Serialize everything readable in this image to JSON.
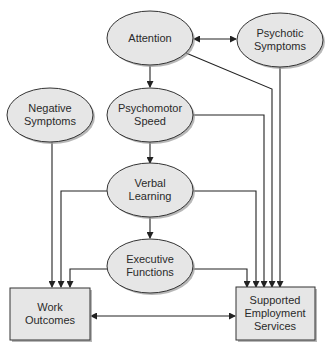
{
  "diagram": {
    "nodes": {
      "attention": {
        "label": "Attention",
        "shape": "ellipse"
      },
      "psychotic": {
        "label_line1": "Psychotic",
        "label_line2": "Symptoms",
        "shape": "ellipse"
      },
      "negative": {
        "label_line1": "Negative",
        "label_line2": "Symptoms",
        "shape": "ellipse"
      },
      "psychomotor": {
        "label_line1": "Psychomotor",
        "label_line2": "Speed",
        "shape": "ellipse"
      },
      "verbal": {
        "label_line1": "Verbal",
        "label_line2": "Learning",
        "shape": "ellipse"
      },
      "executive": {
        "label_line1": "Executive",
        "label_line2": "Functions",
        "shape": "ellipse"
      },
      "work": {
        "label_line1": "Work",
        "label_line2": "Outcomes",
        "shape": "box"
      },
      "ses": {
        "label_line1": "Supported",
        "label_line2": "Employment",
        "label_line3": "Services",
        "shape": "box"
      }
    },
    "edges": [
      {
        "from": "Attention",
        "to": "Psychotic Symptoms",
        "bidirectional": true
      },
      {
        "from": "Attention",
        "to": "Psychomotor Speed"
      },
      {
        "from": "Psychomotor Speed",
        "to": "Verbal Learning"
      },
      {
        "from": "Verbal Learning",
        "to": "Executive Functions"
      },
      {
        "from": "Attention",
        "to": "Supported Employment Services"
      },
      {
        "from": "Psychotic Symptoms",
        "to": "Supported Employment Services"
      },
      {
        "from": "Psychomotor Speed",
        "to": "Supported Employment Services"
      },
      {
        "from": "Verbal Learning",
        "to": "Supported Employment Services"
      },
      {
        "from": "Executive Functions",
        "to": "Supported Employment Services"
      },
      {
        "from": "Negative Symptoms",
        "to": "Work Outcomes"
      },
      {
        "from": "Verbal Learning",
        "to": "Work Outcomes"
      },
      {
        "from": "Executive Functions",
        "to": "Work Outcomes"
      },
      {
        "from": "Work Outcomes",
        "to": "Supported Employment Services",
        "bidirectional": true
      }
    ],
    "colors": {
      "node_fill": "#e6e6e6",
      "stroke": "#333333",
      "shadow": "#9a9a9a"
    }
  }
}
